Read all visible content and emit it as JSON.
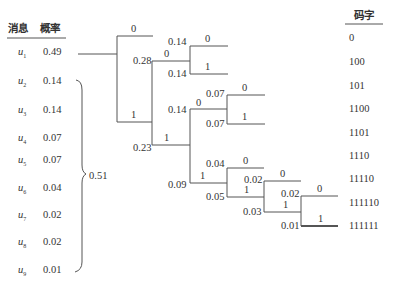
{
  "table": {
    "header_message": "消息",
    "header_prob": "概率",
    "rows": [
      {
        "msg": "u",
        "sub": "1",
        "prob": "0.49"
      },
      {
        "msg": "u",
        "sub": "2",
        "prob": "0.14"
      },
      {
        "msg": "u",
        "sub": "3",
        "prob": "0.14"
      },
      {
        "msg": "u",
        "sub": "4",
        "prob": "0.07"
      },
      {
        "msg": "u",
        "sub": "5",
        "prob": "0.07"
      },
      {
        "msg": "u",
        "sub": "6",
        "prob": "0.04"
      },
      {
        "msg": "u",
        "sub": "7",
        "prob": "0.02"
      },
      {
        "msg": "u",
        "sub": "8",
        "prob": "0.02"
      },
      {
        "msg": "u",
        "sub": "9",
        "prob": "0.01"
      }
    ],
    "brace_sum": "0.51"
  },
  "codewords": {
    "header": "码字",
    "items": [
      "0",
      "100",
      "101",
      "1100",
      "1101",
      "1110",
      "11110",
      "111110",
      "111111"
    ]
  },
  "tree": {
    "labels": {
      "root_0": "0",
      "root_1": "1",
      "n028": "0.28",
      "n028_0": "0",
      "n023": "0.23",
      "n023_1": "1",
      "a014": "0.14",
      "a014_0": "0",
      "b014": "0.14",
      "b014_1": "1",
      "c014": "0.14",
      "c014_0": "0",
      "a007": "0.07",
      "a007_0": "0",
      "b007": "0.07",
      "b007_1": "1",
      "n009": "0.09",
      "n009_1": "1",
      "n004": "0.04",
      "n004_0": "0",
      "n005": "0.05",
      "n005_1": "1",
      "a002": "0.02",
      "a002_0": "0",
      "n003": "0.03",
      "n003_1": "1",
      "b002": "0.02",
      "b002_0": "0",
      "n001": "0.01",
      "n001_1": "1"
    }
  }
}
